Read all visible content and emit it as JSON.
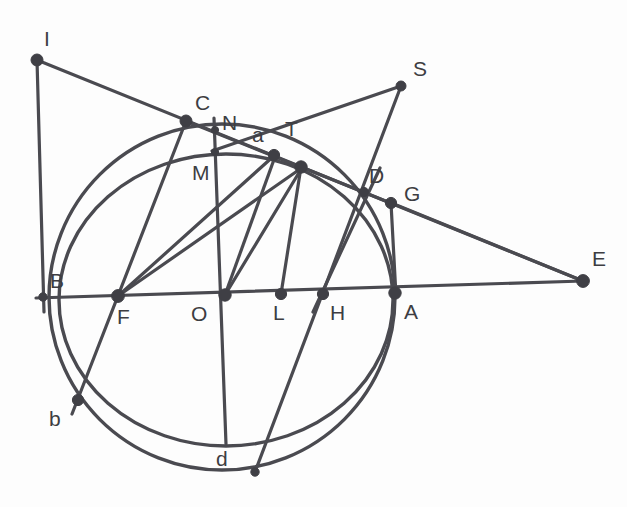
{
  "figure": {
    "width": 627,
    "height": 507,
    "background_color": "#fdfdfd",
    "stroke_color": "#4a4a50",
    "point_fill_color": "#3f3f45",
    "label_color": "#3d3d42"
  },
  "labels": [
    {
      "id": "I",
      "text": "I",
      "x": 44,
      "y": 28
    },
    {
      "id": "C",
      "text": "C",
      "x": 195,
      "y": 92
    },
    {
      "id": "S",
      "text": "S",
      "x": 413,
      "y": 58
    },
    {
      "id": "N",
      "text": "N",
      "x": 222,
      "y": 112
    },
    {
      "id": "a",
      "text": "a",
      "x": 252,
      "y": 124
    },
    {
      "id": "T",
      "text": "T",
      "x": 285,
      "y": 118
    },
    {
      "id": "M",
      "text": "M",
      "x": 192,
      "y": 162
    },
    {
      "id": "D",
      "text": "D",
      "x": 369,
      "y": 165
    },
    {
      "id": "G",
      "text": "G",
      "x": 404,
      "y": 183
    },
    {
      "id": "E",
      "text": "E",
      "x": 592,
      "y": 248
    },
    {
      "id": "B",
      "text": "B",
      "x": 50,
      "y": 270
    },
    {
      "id": "F",
      "text": "F",
      "x": 117,
      "y": 306
    },
    {
      "id": "O",
      "text": "O",
      "x": 191,
      "y": 303
    },
    {
      "id": "L",
      "text": "L",
      "x": 273,
      "y": 302
    },
    {
      "id": "H",
      "text": "H",
      "x": 330,
      "y": 302
    },
    {
      "id": "A",
      "text": "A",
      "x": 404,
      "y": 301
    },
    {
      "id": "b",
      "text": "b",
      "x": 49,
      "y": 408
    },
    {
      "id": "d",
      "text": "d",
      "x": 216,
      "y": 448
    }
  ],
  "points": [
    {
      "id": "I",
      "x": 37,
      "y": 60,
      "r": 6.0
    },
    {
      "id": "C",
      "x": 186,
      "y": 121,
      "r": 6.0
    },
    {
      "id": "S",
      "x": 401,
      "y": 86,
      "r": 5.0
    },
    {
      "id": "N",
      "x": 215,
      "y": 130,
      "r": 3.6
    },
    {
      "id": "M",
      "x": 215,
      "y": 152,
      "r": 3.6
    },
    {
      "id": "a",
      "x": 274,
      "y": 155,
      "r": 5.6
    },
    {
      "id": "T",
      "x": 301,
      "y": 167,
      "r": 6.2
    },
    {
      "id": "D",
      "x": 364,
      "y": 192,
      "r": 4.6
    },
    {
      "id": "G",
      "x": 391,
      "y": 203,
      "r": 5.6
    },
    {
      "id": "E",
      "x": 583,
      "y": 281,
      "r": 6.4
    },
    {
      "id": "B",
      "x": 43,
      "y": 297,
      "r": 4.2
    },
    {
      "id": "F",
      "x": 118,
      "y": 296,
      "r": 6.4
    },
    {
      "id": "O",
      "x": 225,
      "y": 295,
      "r": 6.2
    },
    {
      "id": "L",
      "x": 281,
      "y": 294,
      "r": 5.6
    },
    {
      "id": "H",
      "x": 323,
      "y": 294,
      "r": 5.6
    },
    {
      "id": "A",
      "x": 395,
      "y": 293,
      "r": 6.2
    },
    {
      "id": "b",
      "x": 78,
      "y": 400,
      "r": 5.6
    },
    {
      "id": "d",
      "x": 255,
      "y": 472,
      "r": 4.2
    }
  ],
  "circles": [
    {
      "id": "outer-circle",
      "cx": 222,
      "cy": 297,
      "r": 173,
      "note": "main circle through B, A, d"
    },
    {
      "id": "inner-circle",
      "cx": 225,
      "cy": 300,
      "r": 148,
      "note": "secondary circle through M and d-foot"
    }
  ],
  "segments": [
    {
      "id": "I-B-vertical",
      "from": "I",
      "to": "B-lower",
      "x1": 37,
      "y1": 60,
      "x2": 44,
      "y2": 310
    },
    {
      "id": "I-to-E",
      "from": "I",
      "to": "E",
      "x1": 37,
      "y1": 60,
      "x2": 583,
      "y2": 281
    },
    {
      "id": "B-to-E-axis",
      "from": "B",
      "to": "E",
      "x1": 37,
      "y1": 298,
      "x2": 583,
      "y2": 281
    },
    {
      "id": "C-to-d-vert",
      "from": "C",
      "to": "d-foot",
      "x1": 214,
      "y1": 119,
      "x2": 226,
      "y2": 444
    },
    {
      "id": "C-to-b",
      "from": "C",
      "to": "b",
      "x1": 186,
      "y1": 121,
      "x2": 78,
      "y2": 400
    },
    {
      "id": "C-to-T",
      "from": "C",
      "to": "T",
      "x1": 186,
      "y1": 121,
      "x2": 301,
      "y2": 167
    },
    {
      "id": "F-to-a",
      "from": "F",
      "to": "a",
      "x1": 118,
      "y1": 296,
      "x2": 274,
      "y2": 155
    },
    {
      "id": "F-to-T",
      "from": "F",
      "to": "T",
      "x1": 118,
      "y1": 296,
      "x2": 301,
      "y2": 167
    },
    {
      "id": "O-to-T",
      "from": "O",
      "to": "T",
      "x1": 225,
      "y1": 295,
      "x2": 301,
      "y2": 167
    },
    {
      "id": "O-to-a",
      "from": "O",
      "to": "a",
      "x1": 225,
      "y1": 295,
      "x2": 274,
      "y2": 155
    },
    {
      "id": "L-to-T",
      "from": "L",
      "to": "T",
      "x1": 281,
      "y1": 294,
      "x2": 301,
      "y2": 167
    },
    {
      "id": "S-to-M",
      "from": "S",
      "to": "M",
      "x1": 401,
      "y1": 86,
      "x2": 213,
      "y2": 151
    },
    {
      "id": "S-to-d",
      "from": "S",
      "to": "d",
      "x1": 401,
      "y1": 86,
      "x2": 255,
      "y2": 472
    },
    {
      "id": "T-to-G",
      "from": "T",
      "to": "G",
      "x1": 301,
      "y1": 167,
      "x2": 391,
      "y2": 203
    },
    {
      "id": "G-to-E",
      "from": "G",
      "to": "E",
      "x1": 391,
      "y1": 203,
      "x2": 583,
      "y2": 281
    },
    {
      "id": "G-to-A",
      "from": "G",
      "to": "A",
      "x1": 391,
      "y1": 203,
      "x2": 395,
      "y2": 293
    },
    {
      "id": "D-to-H",
      "from": "D",
      "to": "H",
      "x1": 364,
      "y1": 192,
      "x2": 316,
      "y2": 308
    },
    {
      "id": "H-to-D-ext",
      "from": "H",
      "to": "D-upper",
      "x1": 323,
      "y1": 294,
      "x2": 378,
      "y2": 170
    }
  ]
}
